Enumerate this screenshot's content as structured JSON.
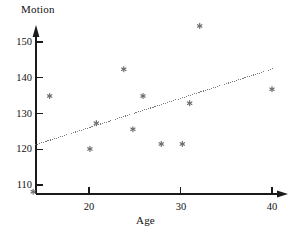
{
  "chart_data": {
    "type": "scatter",
    "title": "",
    "xlabel": "Age",
    "ylabel": "Motion",
    "xlim": [
      13.0,
      41.5
    ],
    "ylim": [
      105.0,
      157.0
    ],
    "grid": false,
    "legend": null,
    "x_ticks": [
      20,
      30,
      40
    ],
    "y_ticks": [
      110,
      120,
      130,
      140,
      150
    ],
    "x_tick_labels": [
      "20",
      "30",
      "40"
    ],
    "y_tick_labels": [
      "110",
      "120",
      "130",
      "140",
      "150"
    ],
    "marker": "asterisk",
    "marker_color": "#6b6b6b",
    "axis_color": "#1a1a1a",
    "points": [
      {
        "x": 13.9,
        "y": 108.1
      },
      {
        "x": 15.7,
        "y": 134.9
      },
      {
        "x": 20.1,
        "y": 120.1
      },
      {
        "x": 20.8,
        "y": 127.3
      },
      {
        "x": 23.8,
        "y": 142.4
      },
      {
        "x": 24.8,
        "y": 125.6
      },
      {
        "x": 25.9,
        "y": 134.9
      },
      {
        "x": 27.9,
        "y": 121.5
      },
      {
        "x": 30.2,
        "y": 121.5
      },
      {
        "x": 31.0,
        "y": 132.9
      },
      {
        "x": 32.1,
        "y": 154.5
      },
      {
        "x": 40.0,
        "y": 136.8
      }
    ],
    "trendline": {
      "style": "dotted",
      "color": "#7a7a7a",
      "x_start": 14.1,
      "y_start": 121.2,
      "x_end": 40.1,
      "y_end": 142.5
    }
  },
  "labels": {
    "y_axis_title": "Motion",
    "x_axis_title": "Age",
    "y_110": "110",
    "y_120": "120",
    "y_130": "130",
    "y_140": "140",
    "y_150": "150",
    "x_20": "20",
    "x_30": "30",
    "x_40": "40"
  }
}
